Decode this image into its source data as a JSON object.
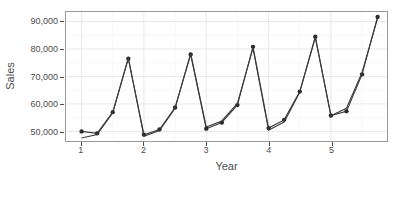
{
  "chart_data": {
    "type": "line",
    "title": "",
    "xlabel": "Year",
    "ylabel": "Sales",
    "xlim": [
      0.75,
      5.9
    ],
    "ylim": [
      46500,
      93500
    ],
    "grid": true,
    "legend": null,
    "x_ticks": [
      1,
      2,
      3,
      4,
      5
    ],
    "x_tick_labels": [
      "1",
      "2",
      "3",
      "4",
      "5"
    ],
    "y_ticks": [
      50000,
      60000,
      70000,
      80000,
      90000
    ],
    "y_tick_labels": [
      "50,000",
      "60,000",
      "70,000",
      "80,000",
      "90,000"
    ],
    "x_minor_ticks": [
      1.5,
      2.5,
      3.5,
      4.5,
      5.5
    ],
    "y_minor_ticks": [
      55000,
      65000,
      75000,
      85000
    ],
    "series": [
      {
        "name": "Actual",
        "color": "#2b2b2b",
        "marker": "circle",
        "x": [
          1.0,
          1.25,
          1.5,
          1.75,
          2.0,
          2.25,
          2.5,
          2.75,
          3.0,
          3.25,
          3.5,
          3.75,
          4.0,
          4.25,
          4.5,
          4.75,
          5.0,
          5.25,
          5.5,
          5.75
        ],
        "y": [
          50000,
          49300,
          57000,
          76500,
          48800,
          50700,
          58700,
          78000,
          51000,
          53200,
          59600,
          80800,
          51200,
          54200,
          64500,
          84500,
          55800,
          57300,
          70800,
          91700
        ]
      },
      {
        "name": "Fitted",
        "color": "#3a3a3a",
        "marker": "none",
        "x": [
          1.0,
          1.25,
          1.5,
          1.75,
          2.0,
          2.25,
          2.5,
          2.75,
          3.0,
          3.25,
          3.5,
          3.75,
          4.0,
          4.25,
          4.5,
          4.75,
          5.0,
          5.25,
          5.5,
          5.75
        ],
        "y": [
          47600,
          48900,
          56800,
          76800,
          48200,
          50300,
          58400,
          78400,
          51600,
          53800,
          60200,
          80300,
          50400,
          53400,
          64200,
          84200,
          55700,
          58400,
          71500,
          91400
        ]
      }
    ]
  }
}
